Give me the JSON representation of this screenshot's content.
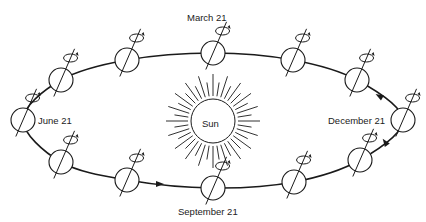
{
  "diagram": {
    "center_label": "Sun",
    "labels": {
      "march": "March 21",
      "june": "June 21",
      "september": "September 21",
      "december": "December 21"
    },
    "colors": {
      "stroke": "#1a1a1a",
      "background": "#ffffff"
    },
    "earths": [
      {
        "id": "march-21",
        "x": 213,
        "y": 53
      },
      {
        "id": "top-right-1",
        "x": 293,
        "y": 60
      },
      {
        "id": "top-right-2",
        "x": 357,
        "y": 80
      },
      {
        "id": "december-21",
        "x": 403,
        "y": 120
      },
      {
        "id": "bottom-right-2",
        "x": 360,
        "y": 160
      },
      {
        "id": "bottom-right-1",
        "x": 294,
        "y": 182
      },
      {
        "id": "september-21",
        "x": 213,
        "y": 188
      },
      {
        "id": "bottom-left-1",
        "x": 127,
        "y": 180
      },
      {
        "id": "bottom-left-2",
        "x": 61,
        "y": 162
      },
      {
        "id": "june-21",
        "x": 23,
        "y": 120
      },
      {
        "id": "top-left-2",
        "x": 61,
        "y": 80
      },
      {
        "id": "top-left-1",
        "x": 127,
        "y": 60
      }
    ]
  }
}
